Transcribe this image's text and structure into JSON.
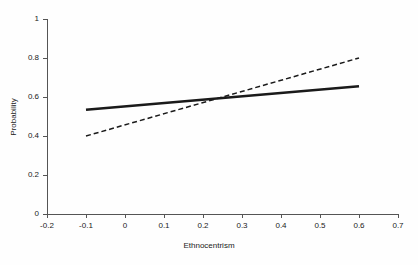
{
  "chart_data": {
    "type": "line",
    "title": "",
    "subtitle": "",
    "xlabel": "Ethnocentrism",
    "ylabel": "Probability",
    "xlim": [
      -0.2,
      0.7
    ],
    "ylim": [
      0,
      1
    ],
    "xticks": [
      "-0.2",
      "-0.1",
      "0",
      "0.1",
      "0.2",
      "0.3",
      "0.4",
      "0.5",
      "0.6",
      "0.7"
    ],
    "xtick_values": [
      -0.2,
      -0.1,
      0,
      0.1,
      0.2,
      0.3,
      0.4,
      0.5,
      0.6,
      0.7
    ],
    "yticks": [
      "0",
      "0.2",
      "0.4",
      "0.6",
      "0.8",
      "1"
    ],
    "ytick_values": [
      0,
      0.2,
      0.4,
      0.6,
      0.8,
      1
    ],
    "grid": false,
    "legend": "none",
    "annotations": [],
    "series": [
      {
        "name": "solid-line",
        "style": "solid",
        "color": "#1a1a1a",
        "width": 2.6,
        "x": [
          -0.1,
          0.6
        ],
        "values": [
          0.535,
          0.655
        ]
      },
      {
        "name": "dashed-line",
        "style": "dashed",
        "color": "#1a1a1a",
        "width": 1.5,
        "dash": "5,3",
        "x": [
          -0.1,
          0.6
        ],
        "values": [
          0.4,
          0.8
        ]
      }
    ],
    "intersection": {
      "x": 0.19,
      "y": 0.59
    }
  },
  "axes": {
    "x_title": "Ethnocentrism",
    "y_title": "Probability",
    "x_tick_labels": [
      "-0.2",
      "-0.1",
      "0",
      "0.1",
      "0.2",
      "0.3",
      "0.4",
      "0.5",
      "0.6",
      "0.7"
    ],
    "y_tick_labels": [
      "0",
      "0.2",
      "0.4",
      "0.6",
      "0.8",
      "1"
    ]
  },
  "colors": {
    "axis": "#555555",
    "line": "#1a1a1a",
    "background": "#fefefe",
    "text": "#1a1a1a"
  }
}
